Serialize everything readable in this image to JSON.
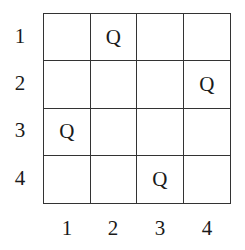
{
  "row_labels": [
    "1",
    "2",
    "3",
    "4"
  ],
  "col_labels": [
    "1",
    "2",
    "3",
    "4"
  ],
  "piece_symbol": "Q",
  "board": [
    [
      "",
      "Q",
      "",
      ""
    ],
    [
      "",
      "",
      "",
      "Q"
    ],
    [
      "Q",
      "",
      "",
      ""
    ],
    [
      "",
      "",
      "Q",
      ""
    ]
  ]
}
